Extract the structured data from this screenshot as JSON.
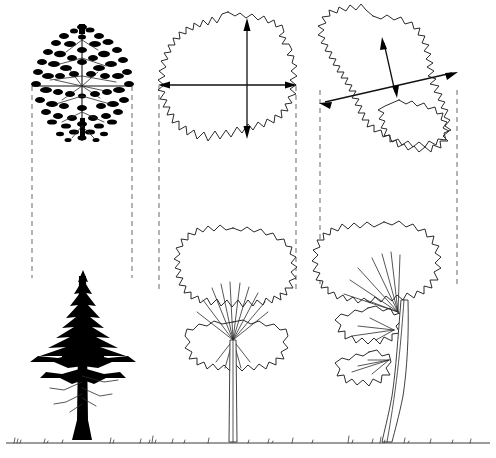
{
  "figure": {
    "title": "Tree crown measurement diagram",
    "background_color": "#ffffff",
    "ink_color": "#1a1a1a",
    "dashed_color": "#8c8c8c",
    "width": 496,
    "height": 458
  },
  "panels": [
    {
      "id": "panel-1",
      "name": "rendered-tree-example",
      "plan": {
        "name": "plan-view-rendered-canopy",
        "style": "detailed stipple foliage",
        "crown_left": 32,
        "crown_right": 132,
        "crown_top": 22,
        "crown_bottom": 142,
        "has_axis_lines": true,
        "axis_orientation": [
          "vertical",
          "horizontal"
        ]
      },
      "elevation": {
        "name": "elevation-view-conifer",
        "style": "solid black silhouette",
        "species_form": "conifer",
        "trunk_x": 83,
        "crown_top": 272,
        "ground_y": 443
      },
      "projection_lines": {
        "name": "projection-dashed-lines",
        "left_x": 32,
        "right_x": 132,
        "top_y": 85,
        "bottom_y": 278
      }
    },
    {
      "id": "panel-2",
      "name": "symmetric-crown-example",
      "plan": {
        "name": "plan-view-crown-outline",
        "style": "lobed outline",
        "crown_left": 158,
        "crown_right": 297,
        "crown_top": 12,
        "crown_bottom": 141,
        "has_axis_lines": false
      },
      "measurements": [
        {
          "name": "crown-width-arrow-horizontal",
          "orientation": "horizontal",
          "x1": 159,
          "y1": 85,
          "x2": 296,
          "y2": 85,
          "double_headed": true
        },
        {
          "name": "crown-width-arrow-vertical",
          "orientation": "vertical",
          "x1": 247,
          "y1": 19,
          "x2": 247,
          "y2": 138,
          "double_headed": true
        }
      ],
      "elevation": {
        "name": "elevation-view-broadleaf",
        "style": "outline",
        "species_form": "broadleaf",
        "trunk_x": 233,
        "crown_top": 228,
        "ground_y": 443
      },
      "projection_lines": {
        "name": "projection-dashed-lines",
        "left_x": 159,
        "right_x": 296,
        "top_y": 85,
        "bottom_y": 290
      }
    },
    {
      "id": "panel-3",
      "name": "irregular-crown-example",
      "plan": {
        "name": "plan-view-crown-outline-irregular",
        "style": "two-lobed irregular outline",
        "crown_left": 318,
        "crown_right": 457,
        "crown_top": 15,
        "crown_bottom": 142,
        "has_axis_lines": false
      },
      "measurements": [
        {
          "name": "crown-longest-axis-arrow",
          "orientation": "diagonal-major",
          "x1": 320,
          "y1": 103,
          "x2": 457,
          "y2": 72,
          "double_headed": true
        },
        {
          "name": "crown-perpendicular-axis-arrow",
          "orientation": "diagonal-minor",
          "x1": 397,
          "y1": 96,
          "x2": 382,
          "y2": 38,
          "double_headed": true
        }
      ],
      "elevation": {
        "name": "elevation-view-leaning-broadleaf",
        "style": "outline",
        "species_form": "broadleaf leaning",
        "trunk_x": 398,
        "crown_top": 222,
        "ground_y": 443
      },
      "projection_lines": {
        "name": "projection-dashed-lines",
        "left_x": 320,
        "right_x": 457,
        "top_y": 90,
        "bottom_y": 288
      }
    }
  ],
  "ground": {
    "name": "ground-line",
    "y": 443,
    "x_start": 6,
    "x_end": 490,
    "has_grass_tufts": true
  }
}
